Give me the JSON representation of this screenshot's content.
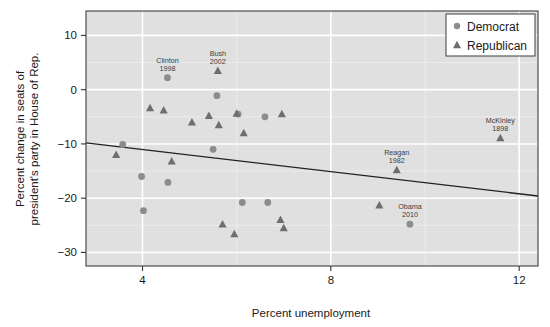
{
  "chart_data": {
    "type": "scatter",
    "title": "",
    "xlabel": "Percent unemployment",
    "ylabel": "Percent change in seats of president's party in House of Rep.",
    "ylabel_line1": "Percent change in seats of",
    "ylabel_line2": "president's party in House of Rep.",
    "xlim": [
      2.8,
      12.4
    ],
    "ylim": [
      -32.5,
      14.5
    ],
    "xticks": [
      4,
      8,
      12
    ],
    "xtick_labels": [
      "4",
      "8",
      "12"
    ],
    "yticks": [
      10,
      0,
      -10,
      -20,
      -30
    ],
    "ytick_labels": [
      "10",
      "0",
      "-10",
      "-20",
      "-30"
    ],
    "grid": true,
    "grid_color": "#ffffff",
    "panel_background": "#e0e0e0",
    "legend": {
      "position": "top-right",
      "entries": [
        {
          "label": "Democrat",
          "marker": "circle",
          "color": "#8c8c8c"
        },
        {
          "label": "Republican",
          "marker": "triangle",
          "color": "#6e6e6e"
        }
      ]
    },
    "trendline": {
      "label": "least-squares fit",
      "color": "#222222",
      "x_start": 2.8,
      "y_start": -9.8,
      "x_end": 12.4,
      "y_end": -19.6
    },
    "series": [
      {
        "name": "Democrat",
        "marker": "circle",
        "color": "#8c8c8c",
        "points": [
          {
            "x": 3.58,
            "y": -10.1,
            "label": ""
          },
          {
            "x": 3.98,
            "y": -16.0,
            "label": ""
          },
          {
            "x": 4.02,
            "y": -22.3,
            "label": ""
          },
          {
            "x": 4.53,
            "y": 2.2,
            "label": "Clinton",
            "label2": "1998"
          },
          {
            "x": 4.54,
            "y": -17.1,
            "label": ""
          },
          {
            "x": 5.5,
            "y": -11.0,
            "label": ""
          },
          {
            "x": 5.58,
            "y": -1.1,
            "label": ""
          },
          {
            "x": 6.03,
            "y": -4.5,
            "label": ""
          },
          {
            "x": 6.12,
            "y": -20.8,
            "label": ""
          },
          {
            "x": 6.66,
            "y": -20.8,
            "label": ""
          },
          {
            "x": 6.6,
            "y": -5.0,
            "label": ""
          },
          {
            "x": 9.68,
            "y": -24.8,
            "label": "Obama",
            "label2": "2010"
          }
        ]
      },
      {
        "name": "Republican",
        "marker": "triangle",
        "color": "#6e6e6e",
        "points": [
          {
            "x": 3.44,
            "y": -12.0,
            "label": ""
          },
          {
            "x": 4.16,
            "y": -3.4,
            "label": ""
          },
          {
            "x": 4.45,
            "y": -3.8,
            "label": ""
          },
          {
            "x": 4.62,
            "y": -13.2,
            "label": ""
          },
          {
            "x": 5.05,
            "y": -6.0,
            "label": ""
          },
          {
            "x": 5.41,
            "y": -4.8,
            "label": ""
          },
          {
            "x": 5.62,
            "y": -6.5,
            "label": ""
          },
          {
            "x": 5.6,
            "y": 3.5,
            "label": "Bush",
            "label2": "2002"
          },
          {
            "x": 5.7,
            "y": -24.8,
            "label": ""
          },
          {
            "x": 5.95,
            "y": -26.6,
            "label": ""
          },
          {
            "x": 6.0,
            "y": -4.4,
            "label": ""
          },
          {
            "x": 6.15,
            "y": -8.0,
            "label": ""
          },
          {
            "x": 6.93,
            "y": -24.0,
            "label": ""
          },
          {
            "x": 7.0,
            "y": -25.5,
            "label": ""
          },
          {
            "x": 6.96,
            "y": -4.5,
            "label": ""
          },
          {
            "x": 9.03,
            "y": -21.3,
            "label": ""
          },
          {
            "x": 9.4,
            "y": -14.8,
            "label": "Reagan",
            "label2": "1982"
          },
          {
            "x": 11.6,
            "y": -8.9,
            "label": "McKinley",
            "label2": "1898"
          }
        ]
      }
    ]
  }
}
